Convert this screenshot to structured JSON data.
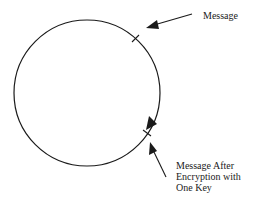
{
  "diagram": {
    "labels": {
      "message": "Message",
      "after_line1": "Message After",
      "after_line2": "Encryption with",
      "after_line3": "One Key"
    },
    "colors": {
      "stroke": "#1a1a1a",
      "background": "#ffffff"
    }
  }
}
